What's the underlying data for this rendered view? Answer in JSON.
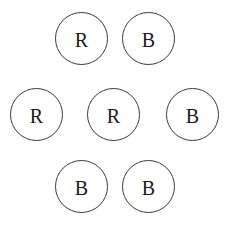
{
  "diagram": {
    "type": "circle-cluster",
    "background_color": "#ffffff",
    "stroke_color": "#3a3a3c",
    "text_color": "#1a1a1a",
    "canvas": {
      "width": 231,
      "height": 225
    },
    "circle_diameter": 53,
    "counts": {
      "R": 3,
      "B": 4,
      "total": 7
    },
    "nodes": [
      {
        "id": "top-left",
        "label": "R",
        "x": 55,
        "y": 12,
        "size": 53,
        "row": "top",
        "column": "left"
      },
      {
        "id": "top-right",
        "label": "B",
        "x": 122,
        "y": 12,
        "size": 53,
        "row": "top",
        "column": "right"
      },
      {
        "id": "middle-left",
        "label": "R",
        "x": 10,
        "y": 88,
        "size": 53,
        "row": "middle",
        "column": "left"
      },
      {
        "id": "middle-center",
        "label": "R",
        "x": 87,
        "y": 88,
        "size": 53,
        "row": "middle",
        "column": "center"
      },
      {
        "id": "middle-right",
        "label": "B",
        "x": 166,
        "y": 88,
        "size": 53,
        "row": "middle",
        "column": "right"
      },
      {
        "id": "bottom-left",
        "label": "B",
        "x": 55,
        "y": 160,
        "size": 53,
        "row": "bottom",
        "column": "left"
      },
      {
        "id": "bottom-right",
        "label": "B",
        "x": 122,
        "y": 160,
        "size": 53,
        "row": "bottom",
        "column": "right"
      }
    ]
  }
}
